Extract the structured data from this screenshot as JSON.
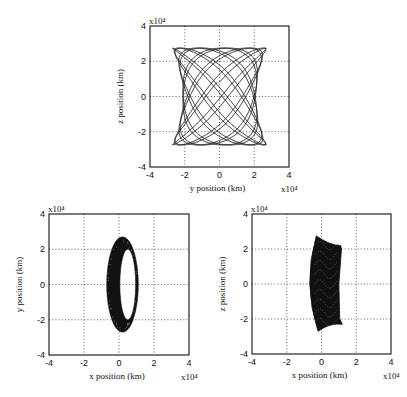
{
  "chart_data": [
    {
      "id": "top",
      "type": "line",
      "title": "",
      "xlabel": "y position (km)",
      "ylabel": "z position (km)",
      "scale_label": "x10⁴",
      "xlim": [
        -4,
        4
      ],
      "ylim": [
        -4,
        4
      ],
      "xticks": [
        "-4",
        "-2",
        "0",
        "2",
        "4"
      ],
      "yticks": [
        "-4",
        "-2",
        "0",
        "2",
        "4"
      ],
      "grid": "dotted",
      "box": {
        "x": 150,
        "y": 26,
        "w": 139,
        "h": 141
      },
      "trajectory": {
        "description": "Lissajous-like quasi-periodic orbit, hourglass envelope",
        "x_range": [
          -2.8,
          2.8
        ],
        "y_range": [
          -2.8,
          2.8
        ],
        "waist_half_width": 2.1,
        "corner_half_width": 2.7,
        "corner_z": 1.9
      }
    },
    {
      "id": "bottom-left",
      "type": "line",
      "title": "",
      "xlabel": "x position (km)",
      "ylabel": "y position (km)",
      "scale_label": "x10⁴",
      "xlim": [
        -4,
        4
      ],
      "ylim": [
        -4,
        4
      ],
      "xticks": [
        "-4",
        "-2",
        "0",
        "2",
        "4"
      ],
      "yticks": [
        "-4",
        "-2",
        "0",
        "2",
        "4"
      ],
      "grid": "dotted",
      "box": {
        "x": 49,
        "y": 214,
        "w": 140,
        "h": 141
      },
      "trajectory": {
        "description": "Filled elliptical ring",
        "outer": {
          "cx": 0.2,
          "cy": 0.0,
          "rx": 0.9,
          "ry": 2.7,
          "x_range": [
            -0.7,
            1.1
          ]
        },
        "inner": {
          "cx": 0.5,
          "cy": 0.0,
          "rx": 0.45,
          "ry": 2.0
        }
      }
    },
    {
      "id": "bottom-right",
      "type": "line",
      "title": "",
      "xlabel": "x position (km)",
      "ylabel": "z position (km)",
      "scale_label": "x10⁴",
      "xlim": [
        -4,
        4
      ],
      "ylim": [
        -4,
        4
      ],
      "xticks": [
        "-4",
        "-2",
        "0",
        "2",
        "4"
      ],
      "yticks": [
        "-4",
        "-2",
        "0",
        "2",
        "4"
      ],
      "grid": "dotted",
      "box": {
        "x": 252,
        "y": 214,
        "w": 139,
        "h": 140
      },
      "trajectory": {
        "description": "Dense wedge/shield-shaped mesh",
        "x_range": [
          -0.8,
          1.2
        ],
        "y_range": [
          -2.7,
          2.8
        ],
        "left_top": [
          -0.3,
          2.75
        ],
        "right_top": [
          1.1,
          2.2
        ],
        "left_bottom": [
          -0.2,
          -2.7
        ],
        "right_bottom": [
          1.2,
          -2.3
        ]
      }
    }
  ]
}
